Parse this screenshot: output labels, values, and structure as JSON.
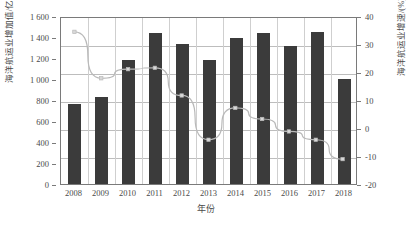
{
  "chart_data": {
    "type": "bar",
    "title": "",
    "subtitle": "",
    "xlabel": "年份",
    "ylabel": "海洋航运业增加值/亿元",
    "y2label": "海洋航运业增速/(%)",
    "categories": [
      "2008",
      "2009",
      "2010",
      "2011",
      "2012",
      "2013",
      "2014",
      "2015",
      "2016",
      "2017",
      "2018"
    ],
    "ylim": [
      0,
      1600
    ],
    "y2lim": [
      -20,
      40
    ],
    "y_ticks": [
      "0",
      "200",
      "400",
      "600",
      "800",
      "1 000",
      "1 200",
      "1 400",
      "1 600"
    ],
    "y_tick_values": [
      0,
      200,
      400,
      600,
      800,
      1000,
      1200,
      1400,
      1600
    ],
    "y2_ticks": [
      "-20",
      "-10",
      "0",
      "10",
      "20",
      "30",
      "40"
    ],
    "y2_tick_values": [
      -20,
      -10,
      0,
      10,
      20,
      30,
      40
    ],
    "grid": true,
    "legend": "none",
    "series": [
      {
        "name": "海洋航运业增加值",
        "type": "bar",
        "axis": "left",
        "unit": "亿元",
        "color": "#3b3b3b",
        "values": [
          760,
          825,
          1180,
          1440,
          1330,
          1180,
          1390,
          1435,
          1315,
          1450,
          1000
        ]
      },
      {
        "name": "海洋航运业增速",
        "type": "line",
        "axis": "right",
        "unit": "%",
        "color": "#b9b9b9",
        "marker_color": "#d8d8d8",
        "values": [
          35.0,
          18.2,
          21.5,
          22.0,
          12.0,
          -4.0,
          7.5,
          3.5,
          -1.0,
          -4.0,
          -11.0
        ]
      }
    ]
  }
}
